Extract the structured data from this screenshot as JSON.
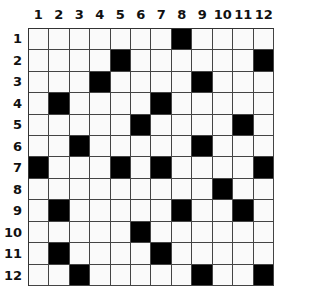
{
  "puzzle": {
    "rows": 12,
    "cols": 12,
    "column_labels": [
      "1",
      "2",
      "3",
      "4",
      "5",
      "6",
      "7",
      "8",
      "9",
      "10",
      "11",
      "12"
    ],
    "row_labels": [
      "1",
      "2",
      "3",
      "4",
      "5",
      "6",
      "7",
      "8",
      "9",
      "10",
      "11",
      "12"
    ],
    "black_cells": [
      [
        1,
        8
      ],
      [
        2,
        5
      ],
      [
        2,
        12
      ],
      [
        3,
        4
      ],
      [
        3,
        9
      ],
      [
        4,
        2
      ],
      [
        4,
        7
      ],
      [
        5,
        6
      ],
      [
        5,
        11
      ],
      [
        6,
        3
      ],
      [
        6,
        9
      ],
      [
        7,
        1
      ],
      [
        7,
        5
      ],
      [
        7,
        7
      ],
      [
        7,
        12
      ],
      [
        8,
        10
      ],
      [
        9,
        2
      ],
      [
        9,
        8
      ],
      [
        9,
        11
      ],
      [
        10,
        6
      ],
      [
        11,
        2
      ],
      [
        11,
        7
      ],
      [
        12,
        3
      ],
      [
        12,
        9
      ],
      [
        12,
        12
      ]
    ],
    "colors": {
      "black_cell": "#000000",
      "white_cell": "#fafafa",
      "grid_line": "#444444"
    }
  }
}
